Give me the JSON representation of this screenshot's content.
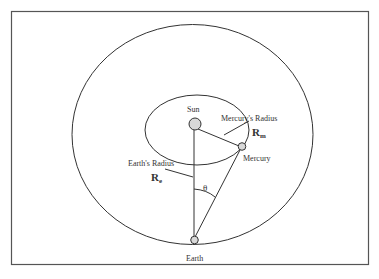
{
  "diagram": {
    "labels": {
      "sun": "Sun",
      "mercury": "Mercury",
      "earth": "Earth",
      "mercury_radius": "Mercury's Radius",
      "earth_radius": "Earth's Radius",
      "rm_base": "R",
      "rm_sub": "m",
      "re_base": "R",
      "re_sub": "e",
      "angle": "θ"
    },
    "colors": {
      "line": "#333333",
      "frame": "#555555",
      "body_fill": "#d9d9d9",
      "background": "#ffffff"
    }
  }
}
